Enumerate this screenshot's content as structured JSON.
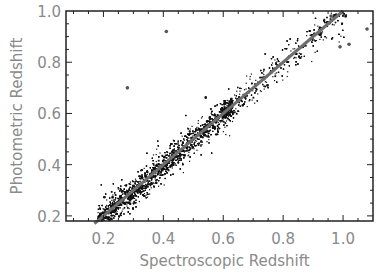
{
  "chart_data": {
    "type": "scatter",
    "title": "",
    "xlabel": "Spectroscopic Redshift",
    "ylabel": "Photometric Redshift",
    "xlim": [
      0.075,
      1.1
    ],
    "ylim": [
      0.18,
      1.0
    ],
    "xticks": [
      0.2,
      0.4,
      0.6,
      0.8,
      1.0
    ],
    "xtick_labels": [
      "0.2",
      "0.4",
      "0.6",
      "0.8",
      "1.0"
    ],
    "yticks": [
      0.2,
      0.4,
      0.6,
      0.8,
      1.0
    ],
    "ytick_labels": [
      "0.2",
      "0.4",
      "0.6",
      "0.8",
      "1.0"
    ],
    "grid": false,
    "legend": null,
    "series": [
      {
        "name": "galaxies",
        "marker": "dot",
        "color": "#111111",
        "description": "Dense cloud of several thousand galaxies tightly scattered about the one-to-one line, densest between z=0.2 and z=0.6, sparser above 0.7",
        "density_profile": {
          "z_range": [
            0.17,
            1.05
          ],
          "scatter_sigma": 0.035,
          "densest_z": [
            0.2,
            0.55
          ]
        }
      },
      {
        "name": "outliers",
        "marker": "circle",
        "color": "#555555",
        "points": [
          {
            "x": 0.28,
            "y": 0.7
          },
          {
            "x": 0.41,
            "y": 0.92
          },
          {
            "x": 0.99,
            "y": 0.86
          },
          {
            "x": 1.02,
            "y": 0.87
          },
          {
            "x": 1.08,
            "y": 0.93
          },
          {
            "x": 0.96,
            "y": 0.98
          }
        ]
      }
    ],
    "reference_line": {
      "label": "y = x",
      "from": [
        0.17,
        0.17
      ],
      "to": [
        1.0,
        1.0
      ],
      "color": "#6e6e6e",
      "width": 3
    }
  }
}
